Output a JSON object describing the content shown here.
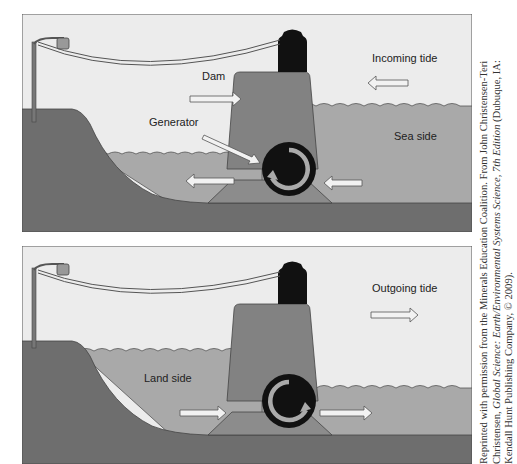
{
  "figure": {
    "panels": [
      {
        "id": "incoming",
        "labels": {
          "dam": "Dam",
          "generator": "Generator",
          "tide": "Incoming tide",
          "side": "Sea side"
        },
        "tide_direction": "right-to-left",
        "flow_direction": "sea-to-land",
        "rotation": "counter-clockwise"
      },
      {
        "id": "outgoing",
        "labels": {
          "tide": "Outgoing tide",
          "side": "Land side"
        },
        "tide_direction": "left-to-right",
        "flow_direction": "land-to-sea",
        "rotation": "clockwise"
      }
    ],
    "colors": {
      "sky": "#ececec",
      "water": "#a9a9a9",
      "ground": "#6e6e6e",
      "dam": "#828282",
      "base": "#8c8c8c",
      "turbine": "#111111",
      "arrow": "#f2f2f2",
      "outline": "#444444"
    }
  },
  "credit": {
    "line1": "Reprinted with permission from the Minerals Education Coalition. From John Christensen-Teri",
    "line2_plain_a": "Christensen, ",
    "line2_italic_a": "Global Science: Earth/Environmental Systems Science, 7th Edition",
    "line2_plain_b": " (Dubuque, IA:",
    "line3": "Kendall Hunt Publishing Company, © 2009)."
  }
}
